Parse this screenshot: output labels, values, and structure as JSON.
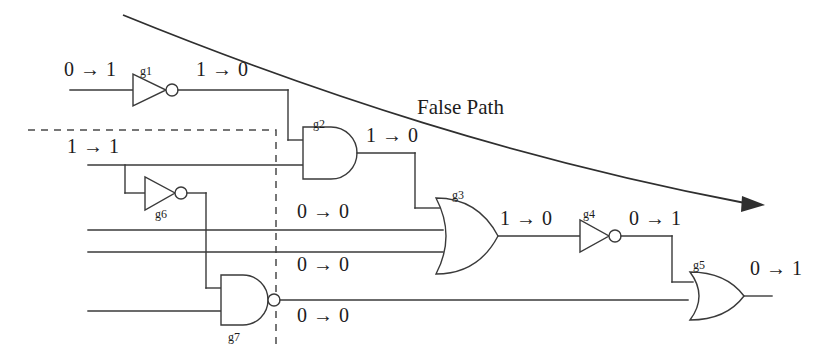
{
  "figure": {
    "type": "logic-circuit-timing-diagram",
    "title": "False Path",
    "background_color": "#ffffff",
    "line_color": "#3a3a3a",
    "text_color": "#1c1c1c"
  },
  "annotations": {
    "false_path": "False Path"
  },
  "gates": [
    {
      "id": "g1",
      "label": "g1",
      "type": "inverter"
    },
    {
      "id": "g2",
      "label": "g2",
      "type": "and"
    },
    {
      "id": "g3",
      "label": "g3",
      "type": "or"
    },
    {
      "id": "g4",
      "label": "g4",
      "type": "inverter"
    },
    {
      "id": "g5",
      "label": "g5",
      "type": "or"
    },
    {
      "id": "g6",
      "label": "g6",
      "type": "inverter"
    },
    {
      "id": "g7",
      "label": "g7",
      "type": "nand"
    }
  ],
  "transitions": {
    "g1_input": "0 → 1",
    "g1_output": "1 → 0",
    "g2_input_lower": "1 → 1",
    "g2_output": "1 → 0",
    "g3_input_mid1": "0 → 0",
    "g3_input_mid2": "0 → 0",
    "g3_output": "1 → 0",
    "g4_output": "0 → 1",
    "g7_output": "0 → 0",
    "g5_output": "0 → 1"
  }
}
